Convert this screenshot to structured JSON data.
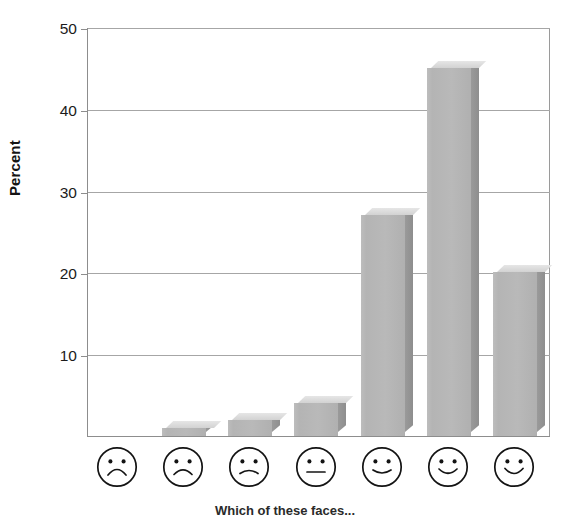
{
  "chart_data": {
    "type": "bar",
    "title": "",
    "subtitle": "",
    "xlabel": "Which of these faces...",
    "ylabel": "Percent",
    "categories": [
      "very-unhappy-face",
      "unhappy-face",
      "slightly-unhappy-face",
      "neutral-face",
      "slightly-happy-face",
      "happy-face",
      "very-happy-face"
    ],
    "category_labels": [
      "face-1-frown-deep",
      "face-2-frown",
      "face-3-frown-slight",
      "face-4-neutral",
      "face-5-smile-slight",
      "face-6-smile",
      "face-7-smile-wide"
    ],
    "values": [
      0,
      1,
      2,
      4,
      27,
      45,
      20
    ],
    "ylim": [
      0,
      50
    ],
    "yticks": [
      10,
      20,
      30,
      40,
      50
    ],
    "ytick_labels": [
      "10",
      "20",
      "30",
      "40",
      "50"
    ],
    "grid": true,
    "legend": false,
    "bar_style": "3d-extruded",
    "colors": {
      "bar_front": "#b7b7b7",
      "bar_top": "#dcdcdc",
      "bar_side": "#949494",
      "gridline": "#a6a6a6",
      "axis": "#8d8d8d",
      "text": "#1b1b1b",
      "background": "#ffffff"
    }
  },
  "axes": {
    "y_title": "Percent",
    "x_title": "Which of these faces...",
    "y_ticks": [
      {
        "label": "50",
        "value": 50
      },
      {
        "label": "40",
        "value": 40
      },
      {
        "label": "30",
        "value": 30
      },
      {
        "label": "20",
        "value": 20
      },
      {
        "label": "10",
        "value": 10
      }
    ]
  }
}
